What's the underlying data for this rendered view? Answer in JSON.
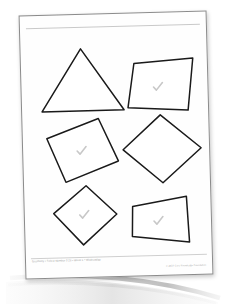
{
  "document": {
    "type": "worksheet",
    "subject_line": "Geometry",
    "orientation_deg": -1.5,
    "paper_color": "#fefefe",
    "background_color": "#ffffff",
    "outline_color": "#1a1a1a",
    "check_color": "#c8c8c8",
    "rule_color": "#c9c9c9"
  },
  "header": {
    "rule_label": "",
    "corner_mark": ""
  },
  "shapes": [
    {
      "id": "shape-1",
      "name": "triangle",
      "label": "triangle",
      "points": "60,16 102,78 20,78",
      "checked": false,
      "check_x": 0,
      "check_y": 0
    },
    {
      "id": "shape-2",
      "name": "parallelogram",
      "label": "parallelogram",
      "points": "113,32 172,28 166,80 106,76",
      "checked": true,
      "check_x": 136,
      "check_y": 56
    },
    {
      "id": "shape-3",
      "name": "rotated-rectangle",
      "label": "rectangle",
      "points": "24,105 76,86 95,129 42,149",
      "checked": true,
      "check_x": 58,
      "check_y": 118
    },
    {
      "id": "shape-4",
      "name": "diamond",
      "label": "square rotated 45 degrees",
      "points": "138,84 178,118 139,152 100,118",
      "checked": false,
      "check_x": 0,
      "check_y": 0
    },
    {
      "id": "shape-5",
      "name": "rhombus",
      "label": "rhombus",
      "points": "62,153 92,182 58,212 29,180",
      "checked": true,
      "check_x": 59,
      "check_y": 182
    },
    {
      "id": "shape-6",
      "name": "trapezoid",
      "label": "trapezoid",
      "points": "108,175 162,166 164,212 107,205",
      "checked": true,
      "check_x": 133,
      "check_y": 190
    }
  ],
  "footer": {
    "left_text": "Geometry  •  Select Number 3.25  •  Week 1  •  Wednesday",
    "right_text": "© 2014 Core Knowledge Foundation"
  }
}
